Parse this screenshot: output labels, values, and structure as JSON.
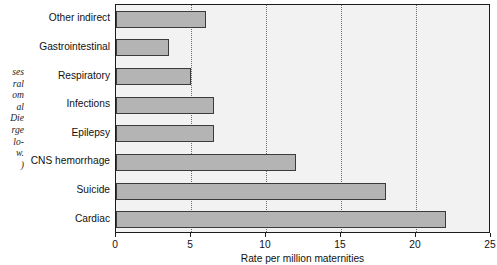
{
  "caption_fragment": {
    "lines": [
      "ses",
      "ral",
      "om",
      "al",
      "Die",
      "rge",
      "lo-",
      "w.",
      ")"
    ]
  },
  "chart_data": {
    "type": "bar",
    "orientation": "horizontal",
    "title": "",
    "xlabel": "Rate per million maternities",
    "ylabel": "",
    "xlim": [
      0,
      25
    ],
    "xticks": [
      0,
      5,
      10,
      15,
      20,
      25
    ],
    "xticklabels": [
      "0",
      "5",
      "10",
      "15",
      "20",
      "25"
    ],
    "grid": "vertical-dotted",
    "legend": "none",
    "categories": [
      "Other indirect",
      "Gastrointestinal",
      "Respiratory",
      "Infections",
      "Epilepsy",
      "CNS hemorrhage",
      "Suicide",
      "Cardiac"
    ],
    "values": [
      6.0,
      3.5,
      5.0,
      6.5,
      6.5,
      12.0,
      18.0,
      22.0
    ],
    "bar_fill_color": "#b4b4b4",
    "bar_edge_color": "#3b3b3b",
    "plot_background": "#f2f2f2",
    "axis_color": "#1c1c1c"
  }
}
